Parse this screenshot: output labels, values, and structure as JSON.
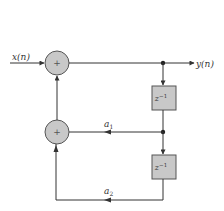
{
  "diagram": {
    "type": "signal-flow / block diagram",
    "input": {
      "label": "x(n)"
    },
    "output": {
      "label": "y(n)"
    },
    "adders": [
      {
        "id": "adder-1",
        "symbol": "+"
      },
      {
        "id": "adder-2",
        "symbol": "+"
      }
    ],
    "delays": [
      {
        "id": "delay-1",
        "label_base": "z",
        "label_exp": "−1"
      },
      {
        "id": "delay-2",
        "label_base": "z",
        "label_exp": "−1"
      }
    ],
    "coefficients": [
      {
        "id": "a1",
        "base": "a",
        "sub": "1"
      },
      {
        "id": "a2",
        "base": "a",
        "sub": "2"
      }
    ],
    "colors": {
      "line": "#333333",
      "adder_fill": "#c8c8c8",
      "delay_fill": "#c8c8c8",
      "stroke": "#555555"
    }
  }
}
